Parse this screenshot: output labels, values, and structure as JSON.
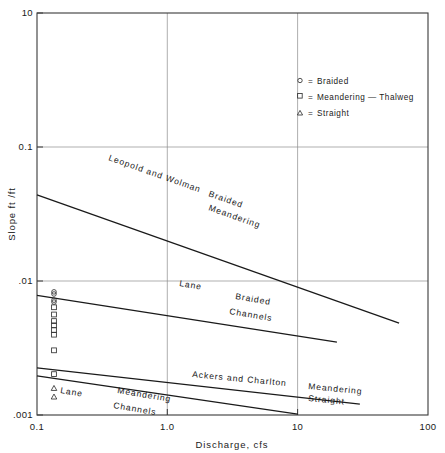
{
  "chart_data": {
    "type": "line",
    "title": "",
    "xlabel": "Discharge, cfs",
    "ylabel": "Slope ft /ft",
    "xscale": "log",
    "yscale": "log",
    "xlim": [
      0.1,
      100
    ],
    "ylim": [
      0.001,
      10
    ],
    "grid": true,
    "xticks": [
      0.1,
      1.0,
      10,
      100
    ],
    "xticklabels": [
      "0.1",
      "1.0",
      "10",
      "100"
    ],
    "yticks": [
      0.001,
      0.01,
      0.1,
      10
    ],
    "yticklabels": [
      ".001",
      ".01",
      "0.1",
      "10"
    ],
    "legend_position": "upper-right",
    "legend": [
      {
        "symbol": "circle",
        "marker": "o",
        "equals": "=",
        "label": "Braided"
      },
      {
        "symbol": "square",
        "marker": "□",
        "equals": "=",
        "label": "Meandering — Thalweg"
      },
      {
        "symbol": "triangle",
        "marker": "△",
        "equals": "=",
        "label": "Straight"
      }
    ],
    "series": [
      {
        "name": "Leopold and Wolman",
        "label_lines": [
          "Leopold and Wolman"
        ],
        "regime_label_lines": [
          "Braided",
          "Meandering"
        ],
        "x": [
          0.1,
          60.0
        ],
        "y": [
          0.155,
          0.0082
        ]
      },
      {
        "name": "Lane Braided Channels",
        "label_lines": [
          "Lane"
        ],
        "regime_label_lines": [
          "Braided",
          "Channels"
        ],
        "x": [
          0.1,
          20.0
        ],
        "y": [
          0.0155,
          0.0053
        ]
      },
      {
        "name": "Ackers and Charlton",
        "label_lines": [
          "Ackers and Charlton"
        ],
        "regime_label_lines": [
          "Meandering",
          "Straight"
        ],
        "x": [
          0.1,
          30.0
        ],
        "y": [
          0.00295,
          0.00128
        ]
      },
      {
        "name": "Lane Meandering Channels",
        "label_lines": [
          "Lane"
        ],
        "regime_label_lines": [
          "Meandering",
          "Channels"
        ],
        "x": [
          0.1,
          10.0
        ],
        "y": [
          0.00245,
          0.00102
        ]
      }
    ],
    "points": [
      {
        "marker": "circle",
        "x": 0.135,
        "y": 0.0168
      },
      {
        "marker": "circle",
        "x": 0.135,
        "y": 0.016
      },
      {
        "marker": "circle",
        "x": 0.135,
        "y": 0.0139
      },
      {
        "marker": "circle",
        "x": 0.135,
        "y": 0.0133
      },
      {
        "marker": "square",
        "x": 0.135,
        "y": 0.0118
      },
      {
        "marker": "square",
        "x": 0.135,
        "y": 0.01
      },
      {
        "marker": "square",
        "x": 0.135,
        "y": 0.0086
      },
      {
        "marker": "square",
        "x": 0.135,
        "y": 0.0078
      },
      {
        "marker": "square",
        "x": 0.135,
        "y": 0.007
      },
      {
        "marker": "square",
        "x": 0.135,
        "y": 0.0063
      },
      {
        "marker": "square",
        "x": 0.135,
        "y": 0.0044
      },
      {
        "marker": "square",
        "x": 0.135,
        "y": 0.00255
      },
      {
        "marker": "triangle",
        "x": 0.135,
        "y": 0.00185
      },
      {
        "marker": "triangle",
        "x": 0.135,
        "y": 0.00152
      }
    ]
  },
  "axes": {
    "x_title": "Discharge, cfs",
    "y_title": "Slope ft /ft",
    "x_tick_labels": [
      "0.1",
      "1.0",
      "10",
      "100"
    ],
    "y_tick_labels": [
      "10",
      "0.1",
      ".01",
      ".001"
    ]
  },
  "legend": {
    "rows": [
      {
        "marker": "o",
        "equals": "=",
        "label": "Braided"
      },
      {
        "marker": "□",
        "equals": "=",
        "label": "Meandering — Thalweg"
      },
      {
        "marker": "△",
        "equals": "=",
        "label": "Straight"
      }
    ]
  },
  "annotations": {
    "leopold_wolman": "Leopold  and  Wolman",
    "braided_upper": "Braided",
    "meandering_upper": "Meandering",
    "lane_braided": "Lane",
    "braided_mid": "Braided",
    "channels_mid": "Channels",
    "ackers_charlton": "Ackers  and  Charlton",
    "lane_meandering": "Lane",
    "meandering_low": "Meandering",
    "channels_low": "Channels",
    "meandering_right": "Meandering",
    "straight_right": "Straight"
  },
  "colors": {
    "background": "#ffffff",
    "ink": "#1a1a1a",
    "frame": "#3a3a3a",
    "grid": "#8d8d8d"
  }
}
